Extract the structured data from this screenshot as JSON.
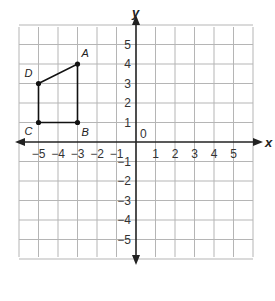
{
  "chart_data": {
    "type": "scatter",
    "title": "",
    "xlabel": "x",
    "ylabel": "y",
    "xlim": [
      -6,
      6
    ],
    "ylim": [
      -6,
      6
    ],
    "grid": true,
    "origin_label": "0",
    "x_ticks": [
      -5,
      -4,
      -3,
      -2,
      -1,
      1,
      2,
      3,
      4,
      5
    ],
    "x_tick_labels": [
      "−5",
      "−4",
      "−3",
      "−2",
      "−1",
      "1",
      "2",
      "3",
      "4",
      "5"
    ],
    "y_ticks": [
      5,
      4,
      3,
      2,
      1,
      -1,
      -2,
      -3,
      -4,
      -5
    ],
    "y_tick_labels": [
      "5",
      "4",
      "3",
      "2",
      "1",
      "−1",
      "−2",
      "−3",
      "−4",
      "−5"
    ],
    "points": [
      {
        "label": "A",
        "x": -3,
        "y": 4
      },
      {
        "label": "B",
        "x": -3,
        "y": 1
      },
      {
        "label": "C",
        "x": -5,
        "y": 1
      },
      {
        "label": "D",
        "x": -5,
        "y": 3
      }
    ],
    "polygon": [
      "A",
      "B",
      "C",
      "D"
    ],
    "colors": {
      "grid": "#b5b5b5",
      "axis": "#222222",
      "shape": "#111111"
    }
  }
}
